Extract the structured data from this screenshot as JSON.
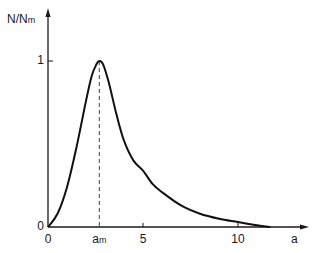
{
  "chart_data": {
    "type": "line",
    "title": "",
    "xlabel": "a",
    "ylabel": "N/N_m",
    "ylabel_main": "N/N",
    "ylabel_sub": "m",
    "x_ticks": [
      {
        "value": 0,
        "label": "0"
      },
      {
        "value": 2.7,
        "label": "a_m",
        "main": "a",
        "sub": "m"
      },
      {
        "value": 5,
        "label": "5"
      },
      {
        "value": 10,
        "label": "10"
      }
    ],
    "y_ticks": [
      {
        "value": 0,
        "label": "0"
      },
      {
        "value": 1,
        "label": "1"
      }
    ],
    "xlim": [
      0,
      13.5
    ],
    "ylim": [
      0,
      1.15
    ],
    "grid": false,
    "legend": null,
    "annotations": [
      {
        "type": "dashed-vertical-line",
        "x": 2.7,
        "label": "a_m",
        "from_y": 0,
        "to_y": 1
      }
    ],
    "series": [
      {
        "name": "N/N_m",
        "x": [
          0,
          0.5,
          1.0,
          1.5,
          2.0,
          2.3,
          2.55,
          2.7,
          2.9,
          3.2,
          3.6,
          4.0,
          4.5,
          5.0,
          5.5,
          6.0,
          7.0,
          8.0,
          9.0,
          10.0,
          11.0,
          11.7
        ],
        "values": [
          0,
          0.08,
          0.24,
          0.48,
          0.76,
          0.91,
          0.98,
          1.0,
          0.98,
          0.87,
          0.68,
          0.52,
          0.4,
          0.34,
          0.26,
          0.21,
          0.13,
          0.08,
          0.05,
          0.03,
          0.01,
          0.0
        ]
      }
    ]
  }
}
